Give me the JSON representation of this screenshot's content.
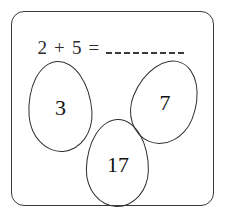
{
  "card": {
    "name": "math-problem-card",
    "border_color": "#3a3a3a",
    "background_color": "#ffffff"
  },
  "equation": {
    "left_operand": "2",
    "operator": "+",
    "right_operand": "5",
    "equals": "=",
    "full_text": "2 + 5 =",
    "blank_dash_count": 9,
    "blank_label": "answer blank"
  },
  "answer_options": [
    {
      "id": "egg-left",
      "shape": "egg",
      "value": "3",
      "correct": false
    },
    {
      "id": "egg-right",
      "shape": "egg",
      "value": "7",
      "correct": true
    },
    {
      "id": "egg-bottom",
      "shape": "egg",
      "value": "17",
      "correct": false
    }
  ],
  "colors": {
    "ink": "#2b2b2b",
    "outline": "#2e2e2e",
    "digit": "#111111"
  }
}
